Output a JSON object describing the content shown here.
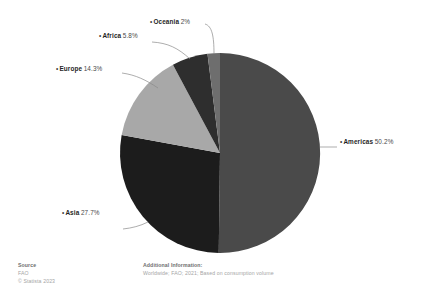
{
  "chart_data": {
    "type": "pie",
    "title": "",
    "labels": [
      "Americas",
      "Asia",
      "Europe",
      "Africa",
      "Oceania"
    ],
    "values": [
      50.2,
      27.7,
      14.3,
      5.8,
      2.0
    ],
    "value_suffix": "%",
    "slices": [
      {
        "label": "Americas",
        "value": 50.2,
        "display": "50.2%",
        "color": "#4a4a4a"
      },
      {
        "label": "Asia",
        "value": 27.7,
        "display": "27.7%",
        "color": "#1c1c1c"
      },
      {
        "label": "Europe",
        "value": 14.3,
        "display": "14.3%",
        "color": "#a8a8a8"
      },
      {
        "label": "Africa",
        "value": 5.8,
        "display": "5.8%",
        "color": "#2e2e2e"
      },
      {
        "label": "Oceania",
        "value": 2.0,
        "display": "2%",
        "color": "#6e6e6e"
      }
    ],
    "legend_position": "callout-labels",
    "start_angle_deg": 0,
    "direction": "clockwise",
    "ylabel": "",
    "xlabel": ""
  },
  "labels": {
    "americas": {
      "bullet": "•",
      "region": "Americas",
      "pct": "50.2%"
    },
    "asia": {
      "bullet": "•",
      "region": "Asia",
      "pct": "27.7%"
    },
    "europe": {
      "bullet": "•",
      "region": "Europe",
      "pct": "14.3%"
    },
    "africa": {
      "bullet": "•",
      "region": "Africa",
      "pct": "5.8%"
    },
    "oceania": {
      "bullet": "•",
      "region": "Oceania",
      "pct": "2%"
    }
  },
  "footer": {
    "source": {
      "heading": "Source",
      "line1": "FAO",
      "line2": "© Statista 2023"
    },
    "additional": {
      "heading": "Additional Information:",
      "line1": "Worldwide; FAO; 2021; Based on consumption volume"
    }
  },
  "colors": {
    "background": "#ffffff",
    "leader_line": "#8a8a8a",
    "text_primary": "#1f1f1f",
    "text_muted": "#a5a5a5"
  }
}
